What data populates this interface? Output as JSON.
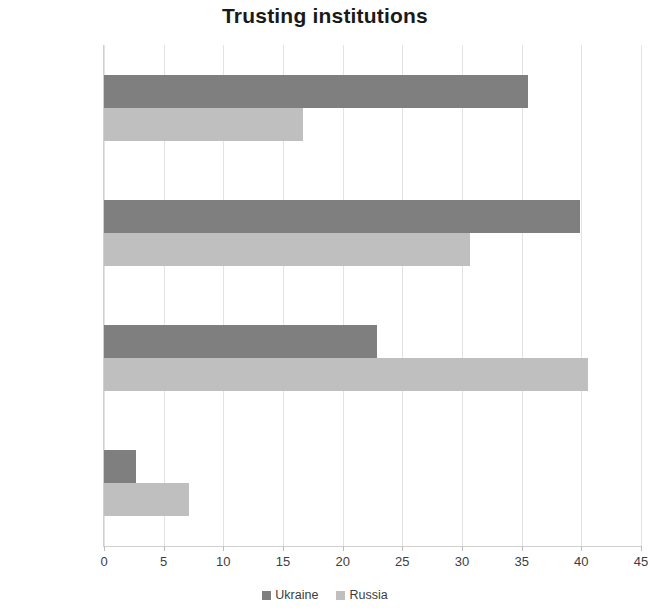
{
  "chart_data": {
    "type": "bar",
    "orientation": "horizontal",
    "title": "Trusting institutions",
    "xlabel": "",
    "ylabel": "",
    "categories": [
      "A great deal",
      "Quite a lot",
      "Not very much",
      "None at all"
    ],
    "categories_top_to_bottom": [
      "None at all",
      "Not very much",
      "Quite a lot",
      "A great deal"
    ],
    "series": [
      {
        "name": "Ukraine",
        "color": "#7f7f7f",
        "values": [
          2.7,
          22.9,
          39.9,
          35.5
        ]
      },
      {
        "name": "Russia",
        "color": "#bfbfbf",
        "values": [
          7.1,
          40.6,
          30.7,
          16.7
        ]
      }
    ],
    "xlim": [
      0,
      45
    ],
    "xticks": [
      0,
      5,
      10,
      15,
      20,
      25,
      30,
      35,
      40,
      45
    ],
    "xtick_labels": [
      "0",
      "5",
      "10",
      "15",
      "20",
      "25",
      "30",
      "35",
      "40",
      "45"
    ],
    "grid": true,
    "grid_axis": "x",
    "legend": [
      "Ukraine",
      "Russia"
    ],
    "legend_position": "bottom"
  },
  "colors": {
    "ukraine": "#7f7f7f",
    "russia": "#bfbfbf",
    "gridline": "#e3e3e3",
    "axis": "#d0d0d0",
    "title_text": "#1a1a1a",
    "label_text": "#3d3d3d",
    "background": "#ffffff"
  }
}
